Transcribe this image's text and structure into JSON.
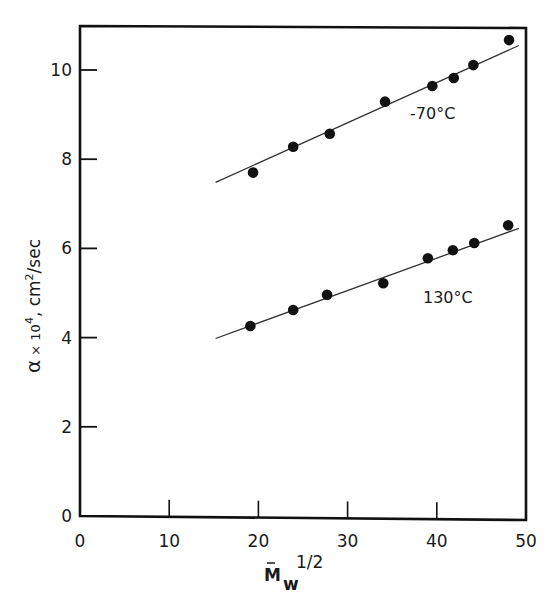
{
  "chart_data": {
    "type": "scatter",
    "title": "",
    "xlabel": "M̄w 1/2",
    "xlabel_parts": {
      "base": "M",
      "sub": "w",
      "sup": "1/2"
    },
    "ylabel": "α × 10⁴, cm²/sec",
    "xlim": [
      0,
      50
    ],
    "ylim": [
      0,
      11
    ],
    "xticks": [
      0,
      10,
      20,
      30,
      40,
      50
    ],
    "yticks": [
      0,
      2,
      4,
      6,
      8,
      10
    ],
    "grid": false,
    "legend": "inline labels",
    "series": [
      {
        "name": "-70°C",
        "marker": "filled-circle",
        "x": [
          19.4,
          23.9,
          28.0,
          34.2,
          39.5,
          41.9,
          44.1,
          48.1
        ],
        "y": [
          7.7,
          8.28,
          8.57,
          9.29,
          9.64,
          9.82,
          10.11,
          10.67
        ],
        "fit_line": {
          "x": [
            15.2,
            49.2
          ],
          "y": [
            7.48,
            10.55
          ]
        }
      },
      {
        "name": "130°C",
        "marker": "filled-circle",
        "x": [
          19.1,
          23.9,
          27.7,
          34.0,
          39.0,
          41.8,
          44.2,
          48.0
        ],
        "y": [
          4.26,
          4.62,
          4.96,
          5.22,
          5.78,
          5.96,
          6.12,
          6.52
        ],
        "fit_line": {
          "x": [
            15.2,
            49.2
          ],
          "y": [
            3.98,
            6.45
          ]
        }
      }
    ]
  },
  "labels": {
    "series_a": "-70°C",
    "series_b": "130°C",
    "y_alpha": "α",
    "y_rest": " × 10",
    "y_exp": "4",
    "y_units": ", cm",
    "y_units_exp": "2",
    "y_units_tail": "/sec",
    "x_base": "M",
    "x_sub": "w",
    "x_sup": "1/2"
  }
}
